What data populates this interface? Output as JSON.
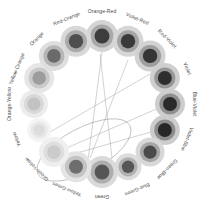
{
  "diagram": {
    "type": "radial-color-wheel",
    "geometry": {
      "center_x": 102,
      "center_y": 104,
      "label_radius": 92,
      "node_radius": 68,
      "sector_count": 16
    },
    "sectors": [
      {
        "index": 0,
        "label": "Orange-Red",
        "angle_deg": -90,
        "outer": "#d4d4d4",
        "mid": "#a8a8a8",
        "core": "#3c3c3c",
        "r_outer": 16,
        "r_mid": 11.5,
        "r_core": 7.5
      },
      {
        "index": 1,
        "label": "Violet-Red",
        "angle_deg": -67.5,
        "outer": "#d6d6d6",
        "mid": "#a4a4a4",
        "core": "#3a3a3a",
        "r_outer": 15.5,
        "r_mid": 11,
        "r_core": 7.2
      },
      {
        "index": 2,
        "label": "Red-Violet",
        "angle_deg": -45,
        "outer": "#d2d2d2",
        "mid": "#9e9e9e",
        "core": "#343434",
        "r_outer": 15.5,
        "r_mid": 11,
        "r_core": 7.2
      },
      {
        "index": 3,
        "label": "Violet",
        "angle_deg": -22.5,
        "outer": "#cfcfcf",
        "mid": "#969696",
        "core": "#2e2e2e",
        "r_outer": 15,
        "r_mid": 10.6,
        "r_core": 7
      },
      {
        "index": 4,
        "label": "Blue-Violet",
        "angle_deg": 0,
        "outer": "#cdcdcd",
        "mid": "#8f8f8f",
        "core": "#2a2a2a",
        "r_outer": 15,
        "r_mid": 10.6,
        "r_core": 7
      },
      {
        "index": 5,
        "label": "Violet-Blue",
        "angle_deg": 22.5,
        "outer": "#cccccc",
        "mid": "#8c8c8c",
        "core": "#272727",
        "r_outer": 15,
        "r_mid": 10.6,
        "r_core": 7
      },
      {
        "index": 6,
        "label": "Green-Blue",
        "angle_deg": 45,
        "outer": "#d8d8d8",
        "mid": "#a6a6a6",
        "core": "#4a4a4a",
        "r_outer": 14.5,
        "r_mid": 10.2,
        "r_core": 6.6
      },
      {
        "index": 7,
        "label": "Blue-Green",
        "angle_deg": 67.5,
        "outer": "#dcdcdc",
        "mid": "#b0b0b0",
        "core": "#565656",
        "r_outer": 13.5,
        "r_mid": 9.6,
        "r_core": 6.2
      },
      {
        "index": 8,
        "label": "Green",
        "angle_deg": 90,
        "outer": "#dadada",
        "mid": "#aeaeae",
        "core": "#555555",
        "r_outer": 16,
        "r_mid": 11.5,
        "r_core": 7.4
      },
      {
        "index": 9,
        "label": "Yellow-Green",
        "angle_deg": 112.5,
        "outer": "#e4e4e4",
        "mid": "#c4c4c4",
        "core": "#6e6e6e",
        "r_outer": 15.5,
        "r_mid": 11,
        "r_core": 7
      },
      {
        "index": 10,
        "label": "Green-Yellow",
        "angle_deg": 135,
        "outer": "#efefef",
        "mid": "#dedede",
        "core": "#cbcbcb",
        "r_outer": 15,
        "r_mid": 10.5,
        "r_core": 6.8
      },
      {
        "index": 11,
        "label": "Yellow",
        "angle_deg": 157.5,
        "outer": "#f4f4f4",
        "mid": "#e8e8e8",
        "core": "#dcdcdc",
        "r_outer": 12,
        "r_mid": 8.6,
        "r_core": 5.6
      },
      {
        "index": 12,
        "label": "Orange-Yellow",
        "angle_deg": 180,
        "outer": "#ececec",
        "mid": "#d8d8d8",
        "core": "#c2c2c2",
        "r_outer": 14,
        "r_mid": 10,
        "r_core": 6.5
      },
      {
        "index": 13,
        "label": "Yellow-Orange",
        "angle_deg": 202.5,
        "outer": "#e6e6e6",
        "mid": "#cacaca",
        "core": "#9c9c9c",
        "r_outer": 15,
        "r_mid": 10.6,
        "r_core": 6.8
      },
      {
        "index": 14,
        "label": "Orange",
        "angle_deg": 225,
        "outer": "#dedede",
        "mid": "#b6b6b6",
        "core": "#6a6a6a",
        "r_outer": 15,
        "r_mid": 10.6,
        "r_core": 6.8
      },
      {
        "index": 15,
        "label": "Red-Orange",
        "angle_deg": 247.5,
        "outer": "#d8d8d8",
        "mid": "#aaaaaa",
        "core": "#4e4e4e",
        "r_outer": 15.5,
        "r_mid": 11,
        "r_core": 7.2
      }
    ],
    "connectors": [
      {
        "from": "Orange-Red",
        "to": "Green",
        "x1": 102,
        "y1": 52,
        "x2": 88,
        "y2": 160
      },
      {
        "from": "Violet-Red",
        "to": "Green",
        "x1": 128,
        "y1": 60,
        "x2": 90,
        "y2": 158
      },
      {
        "from": "Blue-Violet",
        "to": "Green-Yellow",
        "x1": 168,
        "y1": 104,
        "x2": 62,
        "y2": 150
      },
      {
        "from": "Violet-Blue",
        "to": "Yellow-Green",
        "x1": 158,
        "y1": 130,
        "x2": 70,
        "y2": 155
      },
      {
        "from": "Red-Violet",
        "to": "Yellow",
        "x1": 150,
        "y1": 74,
        "x2": 50,
        "y2": 132
      },
      {
        "from": "Orange-Red",
        "to": "Blue-Green",
        "x1": 100,
        "y1": 54,
        "x2": 112,
        "y2": 158
      }
    ],
    "highlight": {
      "name": "selection-ellipse",
      "cx": 84,
      "cy": 150,
      "rx": 52,
      "ry": 22,
      "rotation_deg": -28
    }
  }
}
